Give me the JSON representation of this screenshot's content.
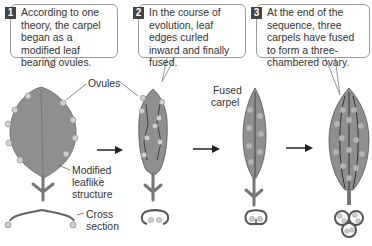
{
  "steps": [
    {
      "number": "1",
      "text": "According to one theory, the carpel began as a modified leaf bearing ovules."
    },
    {
      "number": "2",
      "text": "In the course of evolution, leaf edges curled inward and finally fused."
    },
    {
      "number": "3",
      "text": "At the end of the sequence, three carpels have fused to form a three-chambered ovary."
    }
  ],
  "labels": {
    "ovules": "Ovules",
    "modified_1": "Modified",
    "modified_2": "leaflike",
    "modified_3": "structure",
    "fused_1": "Fused",
    "fused_2": "carpel",
    "cross_1": "Cross",
    "cross_2": "section"
  },
  "colors": {
    "leaf_fill": "#8f8f8f",
    "leaf_dark": "#555555",
    "ovule_fill": "#d0d0d0",
    "callout_border": "#9a9a9a",
    "badge": "#444444"
  }
}
